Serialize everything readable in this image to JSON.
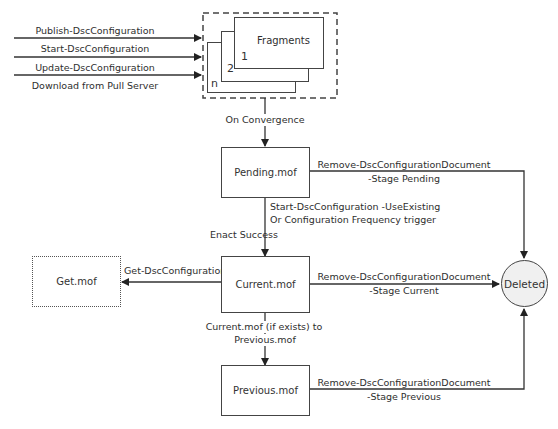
{
  "inputs": [
    {
      "label": "Publish-DscConfiguration"
    },
    {
      "label": "Start-DscConfiguration"
    },
    {
      "label": "Update-DscConfiguration"
    },
    {
      "label": "Download from Pull Server"
    }
  ],
  "fragments": {
    "title": "Fragments",
    "layers": [
      "1",
      "2",
      "n"
    ]
  },
  "edges": {
    "on_convergence": "On Convergence",
    "use_existing_line1": "Start-DscConfiguration -UseExisting",
    "use_existing_line2": "Or Configuration Frequency trigger",
    "enact_success": "Enact Success",
    "get_config": "Get-DscConfiguration",
    "current_to_previous_line1": "Current.mof (if exists) to",
    "current_to_previous_line2": "Previous.mof",
    "remove_pending_line1": "Remove-DscConfigurationDocument",
    "remove_pending_line2": "-Stage Pending",
    "remove_current_line1": "Remove-DscConfigurationDocument",
    "remove_current_line2": "-Stage Current",
    "remove_previous_line1": "Remove-DscConfigurationDocument",
    "remove_previous_line2": "-Stage Previous"
  },
  "nodes": {
    "pending": "Pending.mof",
    "current": "Current.mof",
    "previous": "Previous.mof",
    "get": "Get.mof",
    "deleted": "Deleted"
  }
}
